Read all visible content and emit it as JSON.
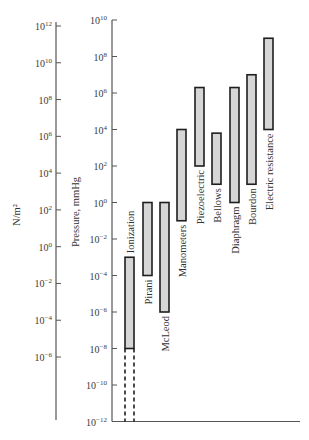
{
  "chart_data": {
    "type": "bar",
    "subtype": "floating-range (log scale)",
    "title": "",
    "orientation": "vertical",
    "left_axis": {
      "label": "N/m²",
      "scale": "log",
      "tick_exponents": [
        12,
        10,
        8,
        6,
        4,
        2,
        0,
        -2,
        -4,
        -6
      ],
      "tick_labels": [
        "10^12",
        "10^10",
        "10^8",
        "10^6",
        "10^4",
        "10^2",
        "10^0",
        "10^-2",
        "10^-4",
        "10^-6"
      ]
    },
    "right_axis": {
      "label": "Pressure, mmHg",
      "scale": "log",
      "range_exponents": [
        -12,
        10
      ],
      "tick_exponents": [
        10,
        8,
        6,
        4,
        2,
        0,
        -2,
        -4,
        -6,
        -8,
        -10,
        -12
      ],
      "tick_labels": [
        "10^10",
        "10^8",
        "10^6",
        "10^4",
        "10^2",
        "10^0",
        "10^-2",
        "10^-4",
        "10^-6",
        "10^-8",
        "10^-10",
        "10^-12"
      ]
    },
    "categories": [
      "Ionization",
      "Pirani",
      "McLeod",
      "Manometers",
      "Piezoelectric",
      "Bellows",
      "Diaphragm",
      "Bourdon",
      "Electric resistance"
    ],
    "series": [
      {
        "name": "Pressure range (mmHg, log10 exponent)",
        "low": [
          -8,
          -4,
          -6,
          -1,
          2,
          1,
          0,
          1,
          4
        ],
        "high": [
          -3,
          0,
          0,
          4,
          6.3,
          3.8,
          6.3,
          7,
          9
        ]
      }
    ],
    "extensions": [
      {
        "category": "Ionization",
        "style": "dashed",
        "low": -12,
        "high": -8
      }
    ],
    "grid": false,
    "legend": null
  },
  "colors": {
    "bar_fill": "#d6d6d6",
    "bar_stroke": "#1e1e1e",
    "axis": "#555555",
    "text": "#333333"
  }
}
